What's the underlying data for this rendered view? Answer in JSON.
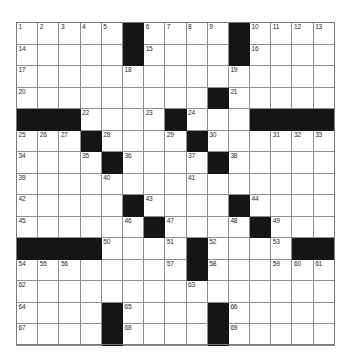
{
  "puzzle": {
    "type": "crossword-grid",
    "rows": 15,
    "columns": 15,
    "cell_size_px": 21.2,
    "colors": {
      "block": "#151515",
      "cell": "#ffffff",
      "gridline": "#8e8e8e",
      "number_text": "#2a2a2a"
    },
    "numbers_total": 69,
    "grid": [
      [
        "1",
        "2",
        "3",
        "4",
        "5",
        "#",
        "6",
        "7",
        "8",
        "9",
        "#",
        "10",
        "11",
        "12",
        "13"
      ],
      [
        "14",
        "",
        "",
        "",
        "",
        "#",
        "15",
        "",
        "",
        "",
        "#",
        "16",
        "",
        "",
        ""
      ],
      [
        "17",
        "",
        "",
        "",
        "",
        "18",
        "",
        "",
        "",
        "",
        "19",
        "",
        "",
        "",
        ""
      ],
      [
        "20",
        "",
        "",
        "",
        "",
        "",
        "",
        "",
        "",
        "#",
        "21",
        "",
        "",
        "",
        ""
      ],
      [
        "#",
        "#",
        "#",
        "22",
        "",
        "",
        "23",
        "#",
        "24",
        "",
        "",
        "#",
        "#",
        "#",
        "#"
      ],
      [
        "25",
        "26",
        "27",
        "#",
        "28",
        "",
        "",
        "29",
        "#",
        "30",
        "",
        "",
        "31",
        "32",
        "33"
      ],
      [
        "34",
        "",
        "",
        "35",
        "#",
        "36",
        "",
        "",
        "37",
        "#",
        "38",
        "",
        "",
        "",
        ""
      ],
      [
        "39",
        "",
        "",
        "",
        "40",
        "",
        "",
        "",
        "41",
        "",
        "",
        "",
        "",
        "",
        ""
      ],
      [
        "42",
        "",
        "",
        "",
        "",
        "#",
        "43",
        "",
        "",
        "",
        "#",
        "44",
        "",
        "",
        ""
      ],
      [
        "45",
        "",
        "",
        "",
        "",
        "46",
        "#",
        "47",
        "",
        "",
        "48",
        "#",
        "49",
        "",
        ""
      ],
      [
        "#",
        "#",
        "#",
        "#",
        "50",
        "",
        "",
        "51",
        "#",
        "52",
        "",
        "",
        "53",
        "#",
        "#"
      ],
      [
        "54",
        "55",
        "56",
        "",
        "",
        "",
        "",
        "57",
        "#",
        "58",
        "",
        "",
        "59",
        "60",
        "61"
      ],
      [
        "62",
        "",
        "",
        "",
        "",
        "",
        "",
        "",
        "63",
        "",
        "",
        "",
        "",
        "",
        ""
      ],
      [
        "64",
        "",
        "",
        "",
        "#",
        "65",
        "",
        "",
        "",
        "#",
        "66",
        "",
        "",
        "",
        ""
      ],
      [
        "67",
        "",
        "",
        "",
        "#",
        "68",
        "",
        "",
        "",
        "#",
        "69",
        "",
        "",
        "",
        ""
      ]
    ],
    "row_1": {
      "numbers": [
        "1",
        "2",
        "3",
        "4",
        "5",
        "6",
        "7",
        "8",
        "9",
        "10",
        "11",
        "12",
        "13"
      ]
    },
    "row_2": {
      "numbers": [
        "14",
        "15",
        "16"
      ]
    },
    "row_3": {
      "numbers": [
        "17",
        "18",
        "19"
      ]
    },
    "row_4": {
      "numbers": [
        "20",
        "21"
      ]
    },
    "row_5": {
      "numbers": [
        "22",
        "23",
        "24"
      ]
    },
    "row_6": {
      "numbers": [
        "25",
        "26",
        "27",
        "28",
        "29",
        "30",
        "31",
        "32",
        "33"
      ]
    },
    "row_7": {
      "numbers": [
        "34",
        "35",
        "36",
        "37",
        "38"
      ]
    },
    "row_8": {
      "numbers": [
        "39",
        "40",
        "41"
      ]
    },
    "row_9": {
      "numbers": [
        "42",
        "43",
        "44"
      ]
    },
    "row_10": {
      "numbers": [
        "45",
        "46",
        "47",
        "48",
        "49"
      ]
    },
    "row_11": {
      "numbers": [
        "50",
        "51",
        "52",
        "53"
      ]
    },
    "row_12": {
      "numbers": [
        "54",
        "55",
        "56",
        "57",
        "58",
        "59",
        "60",
        "61"
      ]
    },
    "row_13": {
      "numbers": [
        "62",
        "63"
      ]
    },
    "row_14": {
      "numbers": [
        "64",
        "65",
        "66"
      ]
    },
    "row_15": {
      "numbers": [
        "67",
        "68",
        "69"
      ]
    }
  }
}
